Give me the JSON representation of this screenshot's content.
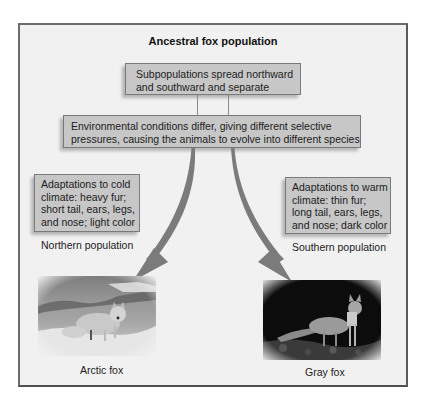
{
  "diagram": {
    "title": "Ancestral fox population",
    "step1": {
      "lines": [
        "Subpopulations spread northward",
        "and southward and separate"
      ]
    },
    "step2": {
      "lines": [
        "Environmental conditions differ, giving different selective",
        "pressures, causing the animals to evolve into different species"
      ]
    },
    "north": {
      "adaptations": [
        "Adaptations to cold",
        "climate: heavy fur;",
        "short tail, ears, legs,",
        "and nose; light color"
      ],
      "population_label": "Northern population",
      "species_label": "Arctic fox",
      "photo": "arctic-fox-photo"
    },
    "south": {
      "adaptations": [
        "Adaptations to warm",
        "climate: thin fur;",
        "long tail, ears, legs,",
        "and nose; dark color"
      ],
      "population_label": "Southern population",
      "species_label": "Gray fox",
      "photo": "gray-fox-photo"
    },
    "colors": {
      "box_fill": "#c7c7c7",
      "box_border": "#7a7a7a",
      "arrow": "#7b7b7b",
      "frame_border": "#5a5a5a",
      "background": "#f1f1f1"
    }
  }
}
